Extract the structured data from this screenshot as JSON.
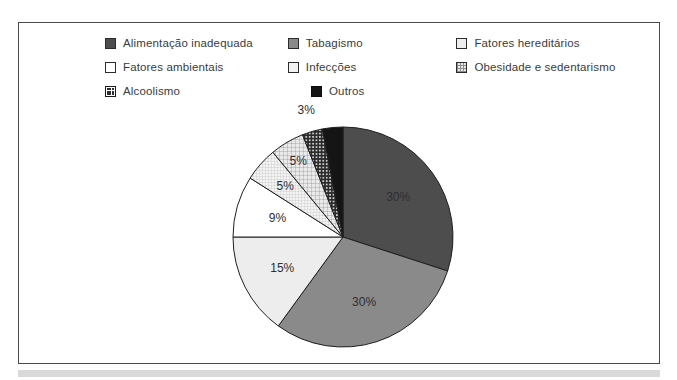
{
  "legend": {
    "rows": [
      [
        {
          "label": "Alimentação inadequada",
          "swatch": "solid-dark",
          "name": "legend-item-alimentacao-inadequada"
        },
        {
          "label": "Tabagismo",
          "swatch": "solid-mid",
          "name": "legend-item-tabagismo"
        },
        {
          "label": "Fatores hereditários",
          "swatch": "pale",
          "name": "legend-item-fatores-hereditarios"
        }
      ],
      [
        {
          "label": "Fatores ambientais",
          "swatch": "white",
          "name": "legend-item-fatores-ambientais"
        },
        {
          "label": "Infecções",
          "swatch": "fine-grid",
          "name": "legend-item-infeccoes"
        },
        {
          "label": "Obesidade e sedentarismo",
          "swatch": "crosshatch",
          "name": "legend-item-obesidade-e-sedentarismo"
        }
      ],
      [
        {
          "label": "Alcoolismo",
          "swatch": "dot-dark",
          "name": "legend-item-alcoolismo"
        },
        {
          "label": "Outros",
          "swatch": "black",
          "name": "legend-item-outros"
        }
      ]
    ]
  },
  "chart_data": {
    "type": "pie",
    "title": "",
    "subtitle": "",
    "xlabel": "",
    "ylabel": "",
    "legend_position": "top",
    "grid": false,
    "total": 100,
    "unit": "%",
    "categories": [
      "Alimentação inadequada",
      "Tabagismo",
      "Fatores hereditários",
      "Fatores ambientais",
      "Infecções",
      "Obesidade e sedentarismo",
      "Alcoolismo",
      "Outros"
    ],
    "values": [
      30,
      30,
      15,
      9,
      5,
      5,
      3,
      3
    ],
    "slices": [
      {
        "label": "Alimentação inadequada",
        "value": 30,
        "display": "30%",
        "fill": "solid-dark",
        "color": "#4d4d4d"
      },
      {
        "label": "Tabagismo",
        "value": 30,
        "display": "30%",
        "fill": "solid-mid",
        "color": "#8a8a8a"
      },
      {
        "label": "Fatores hereditários",
        "value": 15,
        "display": "15%",
        "fill": "pale",
        "color": "#ededed"
      },
      {
        "label": "Fatores ambientais",
        "value": 9,
        "display": "9%",
        "fill": "white",
        "color": "#ffffff"
      },
      {
        "label": "Infecções",
        "value": 5,
        "display": "5%",
        "fill": "fine-grid",
        "color": "#f2f2f2"
      },
      {
        "label": "Obesidade e sedentarismo",
        "value": 5,
        "display": "5%",
        "fill": "crosshatch",
        "color": "#e8e8e8"
      },
      {
        "label": "Alcoolismo",
        "value": 3,
        "display": "3%",
        "fill": "dot-dark",
        "color": "#2e2e2e"
      },
      {
        "label": "Outros",
        "value": 3,
        "display": "3%",
        "fill": "black",
        "color": "#151515"
      }
    ],
    "data_labels": [
      "30%",
      "30%",
      "15%",
      "9%",
      "5%",
      "5%",
      "3%"
    ],
    "start_angle_deg": 0,
    "direction": "clockwise"
  }
}
